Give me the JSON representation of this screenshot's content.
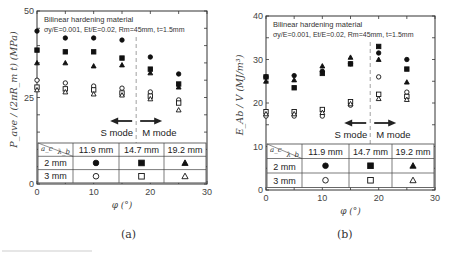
{
  "chart_data": [
    {
      "type": "scatter",
      "panel": "(a)",
      "title": "",
      "annotation": [
        "Bilinear hardening material",
        "σy/E=0.001, Et/E=0.02, Rm=45mm, t=1.5mm"
      ],
      "xlabel": "φ (°)",
      "ylabel": "P_ave / (2πR_m t) (MPa)",
      "xlim": [
        0,
        30
      ],
      "ylim": [
        0,
        50
      ],
      "xticks": [
        0,
        10,
        20,
        30
      ],
      "yticks": [
        0,
        25,
        50
      ],
      "mode_labels": {
        "left": "S mode",
        "right": "M mode",
        "divider_x": 17.5
      },
      "x": [
        0,
        5,
        10,
        15,
        20,
        25
      ],
      "series": [
        {
          "name": "a_c=2 mm, λ_b=11.9 mm",
          "marker": "filled-circle",
          "values": [
            44.2,
            42.2,
            42.2,
            41.6,
            36.7,
            31.8
          ]
        },
        {
          "name": "a_c=2 mm, λ_b=14.7 mm",
          "marker": "filled-square",
          "values": [
            38.7,
            38.2,
            38.2,
            36.4,
            33.2,
            28.9
          ]
        },
        {
          "name": "a_c=2 mm, λ_b=19.2 mm",
          "marker": "filled-triangle",
          "values": [
            35.0,
            35.0,
            34.1,
            34.4,
            32.1,
            28.0
          ]
        },
        {
          "name": "a_c=3 mm, λ_b=11.9 mm",
          "marker": "open-circle",
          "values": [
            30.0,
            29.2,
            28.3,
            27.7,
            26.6,
            24.3
          ]
        },
        {
          "name": "a_c=3 mm, λ_b=14.7 mm",
          "marker": "open-square",
          "values": [
            28.0,
            27.5,
            27.2,
            26.3,
            25.4,
            23.4
          ]
        },
        {
          "name": "a_c=3 mm, λ_b=19.2 mm",
          "marker": "open-triangle",
          "values": [
            27.2,
            26.6,
            26.0,
            25.7,
            24.6,
            21.4
          ]
        }
      ],
      "legend_table": {
        "corner": {
          "row_header": "a_c",
          "col_header": "λ_b"
        },
        "columns": [
          "11.9 mm",
          "14.7 mm",
          "19.2 mm"
        ],
        "rows": [
          {
            "label": "2 mm",
            "markers": [
              "filled-circle",
              "filled-square",
              "filled-triangle"
            ]
          },
          {
            "label": "3 mm",
            "markers": [
              "open-circle",
              "open-square",
              "open-triangle"
            ]
          }
        ]
      }
    },
    {
      "type": "scatter",
      "panel": "(b)",
      "title": "",
      "annotation": [
        "Bilinear hardening material",
        "σy/E=0.001, Et/E=0.02, Rm=45mm, t=1.5mm"
      ],
      "xlabel": "φ (°)",
      "ylabel": "E_Ab / V (MJ/m³)",
      "xlim": [
        0,
        30
      ],
      "ylim": [
        0,
        40
      ],
      "xticks": [
        0,
        10,
        20,
        30
      ],
      "yticks": [
        0,
        10,
        20,
        30,
        40
      ],
      "mode_labels": {
        "left": "S mode",
        "right": "M mode",
        "divider_x": 18.5
      },
      "x": [
        0,
        5,
        10,
        15,
        20,
        25
      ],
      "series": [
        {
          "name": "a_c=2 mm, λ_b=11.9 mm",
          "marker": "filled-circle",
          "values": [
            26.0,
            26.3,
            27.3,
            29.0,
            31.5,
            30.0
          ]
        },
        {
          "name": "a_c=2 mm, λ_b=14.7 mm",
          "marker": "filled-square",
          "values": [
            26.0,
            23.5,
            26.8,
            29.0,
            33.0,
            27.8
          ]
        },
        {
          "name": "a_c=2 mm, λ_b=19.2 mm",
          "marker": "filled-triangle",
          "values": [
            25.0,
            25.3,
            28.5,
            30.5,
            30.0,
            24.8
          ]
        },
        {
          "name": "a_c=3 mm, λ_b=11.9 mm",
          "marker": "open-circle",
          "values": [
            17.0,
            17.0,
            17.0,
            19.5,
            26.0,
            22.5
          ]
        },
        {
          "name": "a_c=3 mm, λ_b=14.7 mm",
          "marker": "open-square",
          "values": [
            18.0,
            18.0,
            18.5,
            20.3,
            22.0,
            21.5
          ]
        },
        {
          "name": "a_c=3 mm, λ_b=19.2 mm",
          "marker": "open-triangle",
          "values": [
            17.5,
            17.5,
            17.8,
            19.8,
            21.0,
            20.8
          ]
        }
      ],
      "legend_table": {
        "corner": {
          "row_header": "a_c",
          "col_header": "λ_b"
        },
        "columns": [
          "11.9 mm",
          "14.7 mm",
          "19.2 mm"
        ],
        "rows": [
          {
            "label": "2 mm",
            "markers": [
              "filled-circle",
              "filled-square",
              "filled-triangle"
            ]
          },
          {
            "label": "3 mm",
            "markers": [
              "open-circle",
              "open-square",
              "open-triangle"
            ]
          }
        ]
      }
    }
  ],
  "captions": {
    "a": "(a)",
    "b": "(b)"
  }
}
